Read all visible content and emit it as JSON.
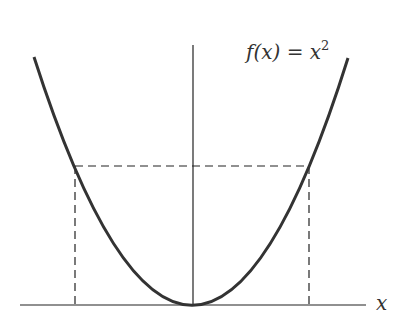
{
  "diagram": {
    "function_label": "f(x) = x",
    "function_exponent": "2",
    "x_axis_label": "x",
    "curve": "parabola y = x^2",
    "colors": {
      "curve": "#333333",
      "axes": "#222222",
      "dashed": "#222222",
      "background": "#ffffff"
    }
  }
}
